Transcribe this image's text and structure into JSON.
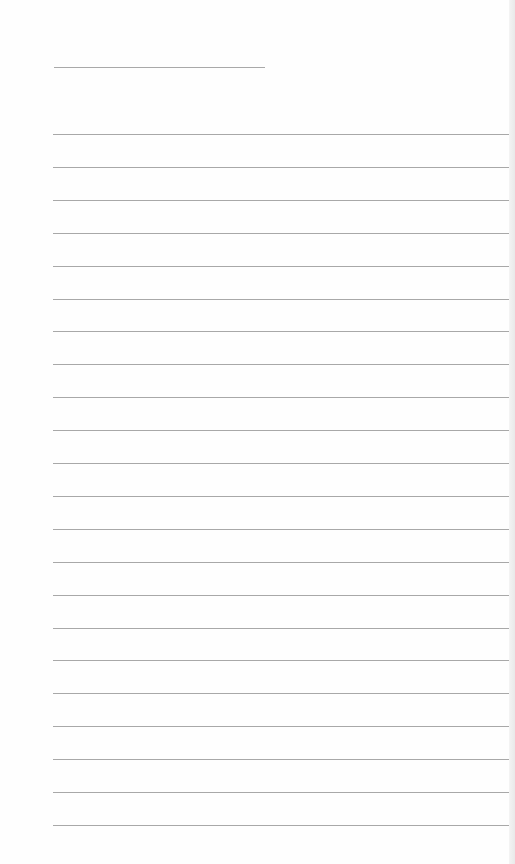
{
  "document": {
    "type": "blank lined paper",
    "header_line": {
      "top": 67,
      "left": 54,
      "width": 211
    },
    "rules": {
      "count": 22,
      "first_top": 134,
      "spacing": 32.9,
      "left": 53,
      "width": 457
    },
    "colors": {
      "paper": "#fefefe",
      "rule": "#a8a8a8",
      "background": "#f7f7f7"
    }
  }
}
